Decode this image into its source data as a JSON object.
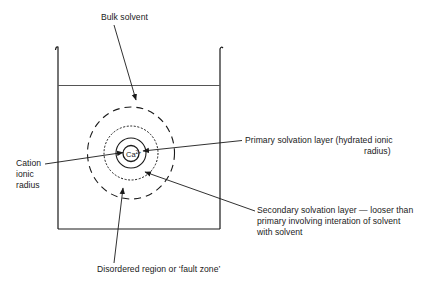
{
  "diagram": {
    "center_ion": {
      "symbol": "Ca",
      "charge": "2+"
    },
    "labels": {
      "bulk_solvent": "Bulk solvent",
      "cation_ionic_radius": [
        "Cation",
        "ionic",
        "radius"
      ],
      "primary_solvation": [
        "Primary solvation layer (hydrated ionic",
        "radius)"
      ],
      "secondary_solvation": [
        "Secondary solvation layer — looser than",
        "primary involving interation of solvent",
        "with solvent"
      ],
      "disordered_region": "Disordered region or ‘fault zone’"
    },
    "layers": [
      {
        "name": "cation",
        "style": "solid"
      },
      {
        "name": "primary solvation layer",
        "style": "solid"
      },
      {
        "name": "secondary solvation layer",
        "style": "dotted"
      },
      {
        "name": "disordered region",
        "style": "dashed"
      }
    ],
    "colors": {
      "ink": "#1a1a1a",
      "background": "#ffffff"
    }
  }
}
